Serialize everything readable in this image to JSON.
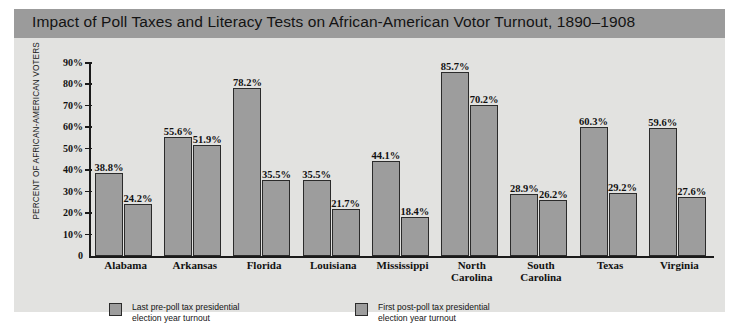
{
  "chart": {
    "title": "Impact of Poll Taxes and Literacy Tests on African-American Votor Turnout, 1890–1908",
    "ylabel": "PERCENT OF AFRICAN-AMERICAN VOTERS",
    "yticks": [
      "90%",
      "80%",
      "70%",
      "60%",
      "50%",
      "40%",
      "30%",
      "20%",
      "10%",
      "0"
    ],
    "legend": [
      {
        "line1": "Last pre-poll tax presidential",
        "line2": "election year turnout"
      },
      {
        "line1": "First post-poll tax presidential",
        "line2": "election year turnout"
      }
    ]
  },
  "colors": {
    "title_bar": "#9b9b9b",
    "panel": "#e2e2e0",
    "bar_fill": "#9d9d9d",
    "bar_stroke": "#2b2b2b",
    "axis": "#1a1a1a",
    "text": "#111111"
  },
  "chart_data": {
    "type": "bar",
    "title": "Impact of Poll Taxes and Literacy Tests on African-American Votor Turnout, 1890–1908",
    "xlabel": "",
    "ylabel": "PERCENT OF AFRICAN-AMERICAN VOTERS",
    "ylim": [
      0,
      90
    ],
    "ytick_values": [
      0,
      10,
      20,
      30,
      40,
      50,
      60,
      70,
      80,
      90
    ],
    "ytick_labels": [
      "0",
      "10%",
      "20%",
      "30%",
      "40%",
      "50%",
      "60%",
      "70%",
      "80%",
      "90%"
    ],
    "grid": false,
    "legend_position": "bottom-left",
    "categories": [
      "Alabama",
      "Arkansas",
      "Florida",
      "Louisiana",
      "Mississippi",
      "North Carolina",
      "South Carolina",
      "Texas",
      "Virginia"
    ],
    "category_lines": [
      [
        "Alabama",
        ""
      ],
      [
        "Arkansas",
        ""
      ],
      [
        "Florida",
        ""
      ],
      [
        "Louisiana",
        ""
      ],
      [
        "Mississippi",
        ""
      ],
      [
        "North",
        "Carolina"
      ],
      [
        "South",
        "Carolina"
      ],
      [
        "Texas",
        ""
      ],
      [
        "Virginia",
        ""
      ]
    ],
    "series": [
      {
        "name": "Last pre-poll tax presidential election year turnout",
        "values": [
          38.8,
          55.6,
          78.2,
          35.5,
          44.1,
          85.7,
          28.9,
          60.3,
          59.6
        ],
        "labels": [
          "38.8%",
          "55.6%",
          "78.2%",
          "35.5%",
          "44.1%",
          "85.7%",
          "28.9%",
          "60.3%",
          "59.6%"
        ]
      },
      {
        "name": "First post-poll tax presidential election year turnout",
        "values": [
          24.2,
          51.9,
          35.5,
          21.7,
          18.4,
          70.2,
          26.2,
          29.2,
          27.6
        ],
        "labels": [
          "24.2%",
          "51.9%",
          "35.5%",
          "21.7%",
          "18.4%",
          "70.2%",
          "26.2%",
          "29.2%",
          "27.6%"
        ]
      }
    ]
  }
}
